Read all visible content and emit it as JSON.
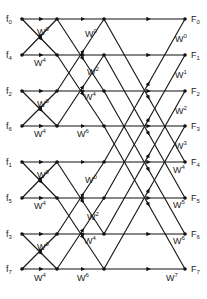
{
  "diagram": {
    "inputs": [
      "f0",
      "f4",
      "f2",
      "f6",
      "f1",
      "f5",
      "f3",
      "f7"
    ],
    "outputs": [
      "F0",
      "F1",
      "F2",
      "F3",
      "F4",
      "F5",
      "F6",
      "F7"
    ],
    "rows_y": [
      19,
      55,
      91,
      126,
      162,
      198,
      234,
      269
    ],
    "cols_x": [
      22,
      57,
      104,
      185
    ],
    "stage1_twiddles": [
      {
        "label": "W0",
        "exp": "0",
        "x": 37,
        "y": 35
      },
      {
        "label": "W4",
        "exp": "4",
        "x": 34,
        "y": 66
      },
      {
        "label": "W0",
        "exp": "0",
        "x": 37,
        "y": 107
      },
      {
        "label": "W4",
        "exp": "4",
        "x": 34,
        "y": 137
      },
      {
        "label": "W0",
        "exp": "0",
        "x": 37,
        "y": 178
      },
      {
        "label": "W4",
        "exp": "4",
        "x": 34,
        "y": 209
      },
      {
        "label": "W0",
        "exp": "0",
        "x": 37,
        "y": 250
      },
      {
        "label": "W4",
        "exp": "4",
        "x": 34,
        "y": 281
      }
    ],
    "stage2_twiddles": [
      {
        "label": "W0",
        "exp": "0",
        "x": 85,
        "y": 37
      },
      {
        "label": "W2",
        "exp": "2",
        "x": 87,
        "y": 75
      },
      {
        "label": "W4",
        "exp": "4",
        "x": 84,
        "y": 100
      },
      {
        "label": "W6",
        "exp": "6",
        "x": 77,
        "y": 137
      },
      {
        "label": "W0",
        "exp": "0",
        "x": 85,
        "y": 183
      },
      {
        "label": "W2",
        "exp": "2",
        "x": 87,
        "y": 220
      },
      {
        "label": "W4",
        "exp": "4",
        "x": 84,
        "y": 244
      },
      {
        "label": "W6",
        "exp": "6",
        "x": 77,
        "y": 281
      }
    ],
    "stage3_twiddles": [
      {
        "label": "W0",
        "exp": "0",
        "x": 175,
        "y": 42
      },
      {
        "label": "W1",
        "exp": "1",
        "x": 175,
        "y": 78
      },
      {
        "label": "W2",
        "exp": "2",
        "x": 175,
        "y": 114
      },
      {
        "label": "W3",
        "exp": "3",
        "x": 175,
        "y": 149
      },
      {
        "label": "W4",
        "exp": "4",
        "x": 173,
        "y": 173
      },
      {
        "label": "W5",
        "exp": "5",
        "x": 173,
        "y": 208
      },
      {
        "label": "W6",
        "exp": "6",
        "x": 173,
        "y": 244
      },
      {
        "label": "W7",
        "exp": "7",
        "x": 166,
        "y": 281
      }
    ]
  }
}
